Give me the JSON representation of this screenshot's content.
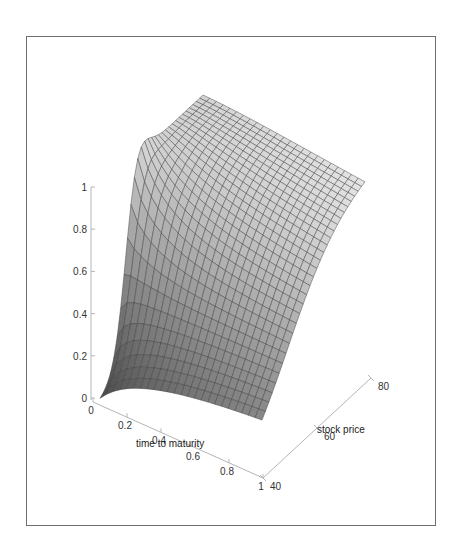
{
  "chart_data": {
    "type": "surface3d",
    "title": "",
    "x_axis": {
      "label": "time to maturity",
      "ticks": [
        "0",
        "0.2",
        "0.4",
        "0.6",
        "0.8",
        "1"
      ],
      "range": [
        0,
        1
      ]
    },
    "y_axis": {
      "label": "stock price",
      "ticks": [
        "40",
        "60",
        "80"
      ],
      "range": [
        40,
        80
      ]
    },
    "z_axis": {
      "label": "",
      "ticks": [
        "0",
        "0.2",
        "0.4",
        "0.6",
        "0.8",
        "1"
      ],
      "range": [
        0,
        1
      ]
    },
    "grid": false,
    "surface": {
      "mesh_lines": true,
      "color": "#c8c8c8",
      "shape": "Near-zero for low stock prices; rises steeply near stock price ~50 at short maturity to ~1 at high stock price; smoother transition for longer maturities"
    }
  },
  "axes": {
    "z_ticks": [
      "0",
      "0.2",
      "0.4",
      "0.6",
      "0.8",
      "1"
    ],
    "x_ticks": [
      "0",
      "0.2",
      "0.4",
      "0.6",
      "0.8",
      "1"
    ],
    "y_ticks": [
      "40",
      "60",
      "80"
    ],
    "x_label": "time to maturity",
    "y_label": "stock price"
  },
  "colors": {
    "frame": "#6e6e6e",
    "axis": "#b5b5b5",
    "surface_light": "#d6d6d6",
    "surface_dark": "#4a4a4a",
    "mesh": "#3a3a3a"
  }
}
